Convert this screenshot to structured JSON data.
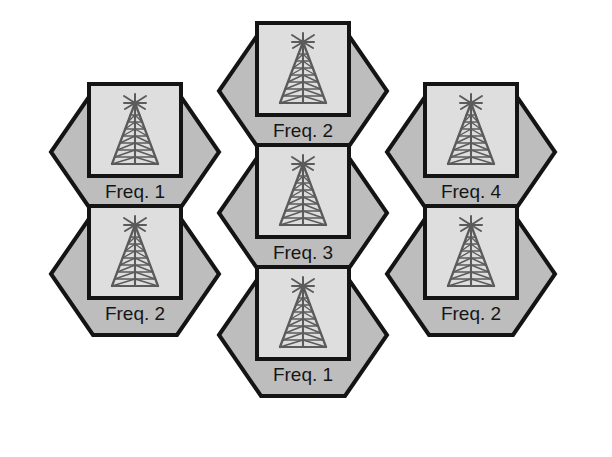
{
  "diagram": {
    "type": "hexagonal-cell-layout",
    "canvas": {
      "width": 612,
      "height": 457
    },
    "colors": {
      "background": "#ffffff",
      "hex_fill": "#bdbdbd",
      "hex_stroke": "#141414",
      "box_fill": "#dedede",
      "box_stroke": "#141414",
      "tower_stroke": "#5b5b5b",
      "label_color": "#151515"
    },
    "geometry": {
      "hex_half_width": 84,
      "hex_half_height": 61,
      "hex_flat_half": 42,
      "hex_stroke_width": 4,
      "box_width": 92,
      "box_height": 92,
      "box_stroke_width": 4,
      "box_offset_y": -22,
      "label_offset_y": 46
    },
    "cells": [
      {
        "id": "cell-top-center",
        "label": "Freq. 2",
        "frequency": 2,
        "cx": 303,
        "cy": 91
      },
      {
        "id": "cell-upper-left",
        "label": "Freq. 1",
        "frequency": 1,
        "cx": 135,
        "cy": 152
      },
      {
        "id": "cell-upper-right",
        "label": "Freq. 4",
        "frequency": 4,
        "cx": 471,
        "cy": 152
      },
      {
        "id": "cell-center",
        "label": "Freq. 3",
        "frequency": 3,
        "cx": 303,
        "cy": 213
      },
      {
        "id": "cell-lower-left",
        "label": "Freq. 2",
        "frequency": 2,
        "cx": 135,
        "cy": 274
      },
      {
        "id": "cell-lower-right",
        "label": "Freq. 2",
        "frequency": 2,
        "cx": 471,
        "cy": 274
      },
      {
        "id": "cell-bottom-center",
        "label": "Freq. 1",
        "frequency": 1,
        "cx": 303,
        "cy": 335
      }
    ],
    "tower_icon": {
      "name": "cell-tower-icon",
      "description": "Lattice radio mast with antenna array at apex"
    }
  }
}
